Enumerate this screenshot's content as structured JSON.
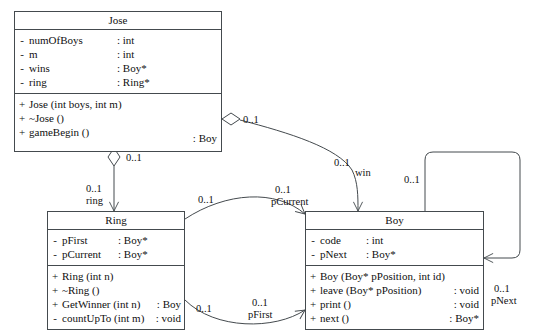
{
  "diagram": {
    "kind": "uml-class-diagram",
    "background": "#ffffff",
    "line_color": "#444a4e",
    "text_color": "#101010"
  },
  "classes": {
    "jose": {
      "name": "Jose",
      "attributes": [
        {
          "vis": "-",
          "name": "numOfBoys",
          "type": ": int"
        },
        {
          "vis": "-",
          "name": "m",
          "type": ": int"
        },
        {
          "vis": "-",
          "name": "wins",
          "type": ": Boy*"
        },
        {
          "vis": "-",
          "name": "ring",
          "type": ": Ring*"
        }
      ],
      "operations": [
        {
          "vis": "+",
          "name": "Jose (int boys, int m)",
          "type": ""
        },
        {
          "vis": "+",
          "name": "~Jose ()",
          "type": ""
        },
        {
          "vis": "+",
          "name": "gameBegin ()",
          "type": ": Boy"
        }
      ]
    },
    "ring": {
      "name": "Ring",
      "attributes": [
        {
          "vis": "-",
          "name": "pFirst",
          "type": ": Boy*"
        },
        {
          "vis": "-",
          "name": "pCurrent",
          "type": ": Boy*"
        }
      ],
      "operations": [
        {
          "vis": "+",
          "name": "Ring (int n)",
          "type": ""
        },
        {
          "vis": "+",
          "name": "~Ring ()",
          "type": ""
        },
        {
          "vis": "+",
          "name": "GetWinner (int n)",
          "type": ": Boy"
        },
        {
          "vis": "-",
          "name": "countUpTo (int m)",
          "type": ": void"
        }
      ]
    },
    "boy": {
      "name": "Boy",
      "attributes": [
        {
          "vis": "-",
          "name": "code",
          "type": ": int"
        },
        {
          "vis": "-",
          "name": "pNext",
          "type": ": Boy*"
        }
      ],
      "operations": [
        {
          "vis": "+",
          "name": "Boy (Boy* pPosition, int id)",
          "type": ""
        },
        {
          "vis": "+",
          "name": "leave (Boy* pPosition)",
          "type": ": void"
        },
        {
          "vis": "+",
          "name": "print ()",
          "type": ": void"
        },
        {
          "vis": "+",
          "name": "next ()",
          "type": ": Boy*"
        }
      ]
    }
  },
  "associations": {
    "jose_ring": {
      "source_mult": "0..1",
      "target_mult": "0..1",
      "target_role": "ring"
    },
    "jose_boy_win": {
      "source_mult": "0..1",
      "target_mult": "0..1",
      "target_role": "win"
    },
    "ring_boy_pcurrent": {
      "source_mult": "0..1",
      "target_mult": "0..1",
      "target_role": "pCurrent"
    },
    "ring_boy_pfirst": {
      "source_mult": "0..1",
      "target_mult": "0..1",
      "target_role": "pFirst"
    },
    "boy_boy_pnext": {
      "source_mult": "0..1",
      "target_mult": "0..1",
      "target_role": "pNext"
    }
  }
}
